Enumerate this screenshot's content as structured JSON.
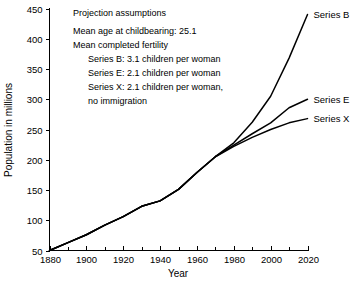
{
  "chart_data": {
    "type": "line",
    "title": "",
    "xlabel": "Year",
    "ylabel": "Population in millions",
    "xlim": [
      1880,
      2020
    ],
    "ylim": [
      50,
      450
    ],
    "grid": false,
    "legend_position": "right-inline-labels",
    "x_ticks": [
      1880,
      1900,
      1920,
      1940,
      1960,
      1980,
      2000,
      2020
    ],
    "x_minor_ticks": [
      1890,
      1910,
      1930,
      1950,
      1970,
      1990,
      2010
    ],
    "y_ticks": [
      50,
      100,
      150,
      200,
      250,
      300,
      350,
      400,
      450
    ],
    "series": [
      {
        "name": "Series B",
        "label": "Series B",
        "x": [
          1880,
          1890,
          1900,
          1910,
          1920,
          1930,
          1940,
          1950,
          1960,
          1970,
          1980,
          1990,
          2000,
          2010,
          2020
        ],
        "values": [
          50,
          63,
          76,
          92,
          106,
          123,
          132,
          151,
          179,
          205,
          228,
          262,
          305,
          368,
          440
        ]
      },
      {
        "name": "Series E",
        "label": "Series E",
        "x": [
          1880,
          1890,
          1900,
          1910,
          1920,
          1930,
          1940,
          1950,
          1960,
          1970,
          1980,
          1990,
          2000,
          2010,
          2020
        ],
        "values": [
          50,
          63,
          76,
          92,
          106,
          123,
          132,
          151,
          179,
          205,
          224,
          243,
          261,
          286,
          300
        ]
      },
      {
        "name": "Series X",
        "label": "Series X",
        "x": [
          1880,
          1890,
          1900,
          1910,
          1920,
          1930,
          1940,
          1950,
          1960,
          1970,
          1980,
          1990,
          2000,
          2010,
          2020
        ],
        "values": [
          50,
          63,
          76,
          92,
          106,
          123,
          132,
          151,
          179,
          205,
          222,
          237,
          250,
          261,
          268
        ]
      }
    ],
    "annotations": {
      "heading": "Projection assumptions",
      "lines": [
        "Mean age at childbearing: 25.1",
        "Mean completed fertility"
      ],
      "series_assumptions": [
        "Series B:  3.1 children per woman",
        "Series E:  2.1 children per woman",
        "Series X:  2.1 children per woman,",
        "no immigration"
      ]
    }
  }
}
